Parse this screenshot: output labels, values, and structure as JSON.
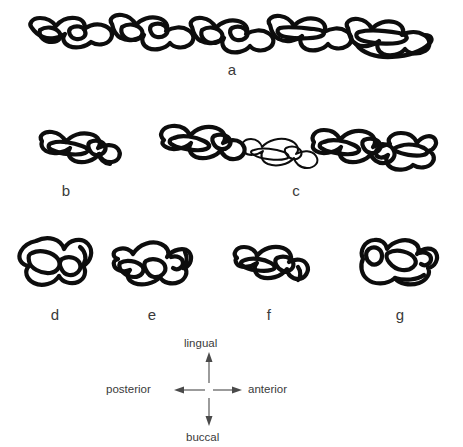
{
  "figure": {
    "type": "scientific-line-drawing",
    "background_color": "#ffffff",
    "ink_color": "#0d0d0d",
    "label_color": "#3a3a3a"
  },
  "panels": [
    {
      "id": "a",
      "label": "a",
      "description": "complete upper molar tooth row, occlusal view, seven cusped loph units"
    },
    {
      "id": "b",
      "label": "b",
      "description": "single isolated molar, occlusal view"
    },
    {
      "id": "c",
      "label": "c",
      "description": "partial molar row of three to four teeth, occlusal view"
    },
    {
      "id": "d",
      "label": "d",
      "description": "isolated molar with two large rounded lophs"
    },
    {
      "id": "e",
      "label": "e",
      "description": "isolated molar with elongate crown and enamel loops"
    },
    {
      "id": "f",
      "label": "f",
      "description": "isolated molar with narrow crown and paired lobes"
    },
    {
      "id": "g",
      "label": "g",
      "description": "isolated molar with crescentic enamel pattern"
    }
  ],
  "compass": {
    "name": "orientation-compass",
    "up": "lingual",
    "down": "buccal",
    "left": "posterior",
    "right": "anterior"
  }
}
